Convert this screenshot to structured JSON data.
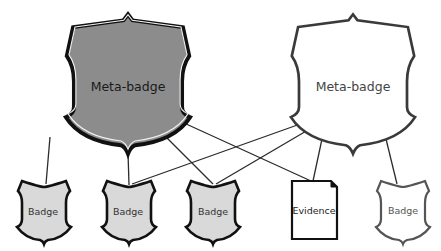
{
  "diagram": {
    "colors": {
      "meta_dark_fill": "#8c8c8c",
      "meta_light_fill": "#ffffff",
      "badge_fill": "#d9d9d9",
      "badge_white_fill": "#ffffff",
      "outline_dark": "#1a1a1a",
      "outline_gray": "#555555",
      "line": "#2b2b2b"
    },
    "nodes": {
      "meta_left": {
        "label": "Meta-badge",
        "style": "filled-dark"
      },
      "meta_right": {
        "label": "Meta-badge",
        "style": "outline"
      },
      "badge_1": {
        "label": "Badge",
        "style": "filled-light"
      },
      "badge_2": {
        "label": "Badge",
        "style": "filled-light"
      },
      "badge_3": {
        "label": "Badge",
        "style": "filled-light"
      },
      "evidence": {
        "label": "Evidence",
        "style": "document"
      },
      "badge_5": {
        "label": "Badge",
        "style": "outline"
      }
    },
    "edges": [
      {
        "from": "meta_left",
        "to": "badge_1"
      },
      {
        "from": "meta_left",
        "to": "badge_2"
      },
      {
        "from": "meta_left",
        "to": "badge_3"
      },
      {
        "from": "meta_left",
        "to": "evidence"
      },
      {
        "from": "meta_right",
        "to": "badge_2"
      },
      {
        "from": "meta_right",
        "to": "badge_3"
      },
      {
        "from": "meta_right",
        "to": "evidence"
      },
      {
        "from": "meta_right",
        "to": "badge_5"
      }
    ]
  }
}
